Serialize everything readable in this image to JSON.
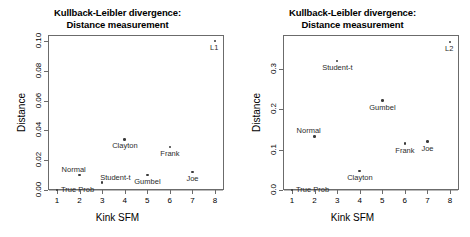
{
  "figure": {
    "background_color": "#ffffff",
    "point_color": "#3a3a3a",
    "axis_color": "#6b6b6b"
  },
  "chart_data": [
    {
      "type": "scatter",
      "panel": "left",
      "title": "Kullback-Leibler divergence:\nDistance measurement",
      "xlabel": "Kink SFM",
      "ylabel": "Distance",
      "xlim": [
        0.6,
        8.4
      ],
      "ylim": [
        0.0,
        0.104
      ],
      "xticks": [
        1,
        2,
        3,
        4,
        5,
        6,
        7,
        8
      ],
      "xtick_labels": [
        "1",
        "2",
        "3",
        "4",
        "5",
        "6",
        "7",
        "8"
      ],
      "yticks": [
        0.0,
        0.02,
        0.04,
        0.06,
        0.08,
        0.1
      ],
      "ytick_labels": [
        "0.00",
        "0.02",
        "0.04",
        "0.06",
        "0.08",
        "0.10"
      ],
      "grid": false,
      "legend": "none",
      "points": [
        {
          "label": "True Prob",
          "x": 1,
          "y": 0.0,
          "label_pos": "right"
        },
        {
          "label": "Normal",
          "x": 2,
          "y": 0.01,
          "label_pos": "above-left"
        },
        {
          "label": "Student-t",
          "x": 3,
          "y": 0.005,
          "label_pos": "above-right"
        },
        {
          "label": "Clayton",
          "x": 4,
          "y": 0.034,
          "label_pos": "below"
        },
        {
          "label": "Gumbel",
          "x": 5,
          "y": 0.01,
          "label_pos": "below"
        },
        {
          "label": "Frank",
          "x": 6,
          "y": 0.029,
          "label_pos": "below"
        },
        {
          "label": "Joe",
          "x": 7,
          "y": 0.012,
          "label_pos": "below"
        },
        {
          "label": "L1",
          "x": 8,
          "y": 0.1,
          "label_pos": "below-left"
        }
      ]
    },
    {
      "type": "scatter",
      "panel": "right",
      "title": "Kullback-Leibler divergence:\nDistance measurement",
      "xlabel": "Kink SFM",
      "ylabel": "Distance",
      "xlim": [
        0.6,
        8.4
      ],
      "ylim": [
        0.0,
        0.385
      ],
      "xticks": [
        1,
        2,
        3,
        4,
        5,
        6,
        7,
        8
      ],
      "xtick_labels": [
        "1",
        "2",
        "3",
        "4",
        "5",
        "6",
        "7",
        "8"
      ],
      "yticks": [
        0.0,
        0.1,
        0.2,
        0.3
      ],
      "ytick_labels": [
        "0.0",
        "0.1",
        "0.2",
        "0.3"
      ],
      "grid": false,
      "legend": "none",
      "points": [
        {
          "label": "True Prob",
          "x": 1,
          "y": 0.0,
          "label_pos": "right"
        },
        {
          "label": "Normal",
          "x": 2,
          "y": 0.133,
          "label_pos": "above-left"
        },
        {
          "label": "Student-t",
          "x": 3,
          "y": 0.32,
          "label_pos": "below"
        },
        {
          "label": "Clayton",
          "x": 4,
          "y": 0.047,
          "label_pos": "below"
        },
        {
          "label": "Gumbel",
          "x": 5,
          "y": 0.222,
          "label_pos": "below"
        },
        {
          "label": "Frank",
          "x": 6,
          "y": 0.115,
          "label_pos": "below"
        },
        {
          "label": "Joe",
          "x": 7,
          "y": 0.12,
          "label_pos": "below"
        },
        {
          "label": "L2",
          "x": 8,
          "y": 0.368,
          "label_pos": "below-left"
        }
      ]
    }
  ]
}
